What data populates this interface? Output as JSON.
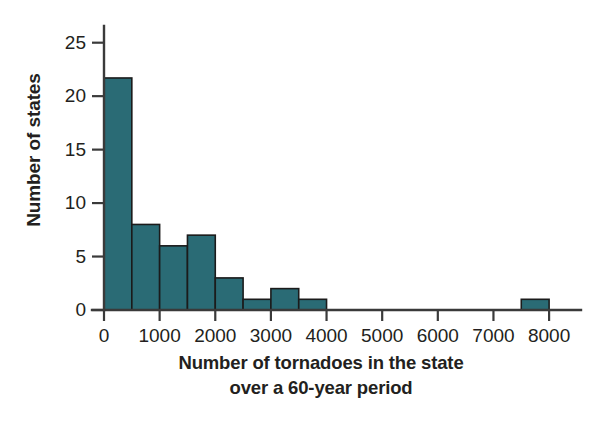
{
  "chart_data": {
    "type": "bar",
    "subtype": "histogram",
    "title": "",
    "subtitle": "",
    "xlabel": "Number of tornadoes in the state over a 60-year period",
    "xlabel_line1": "Number of tornadoes in the state",
    "xlabel_line2": "over a 60-year period",
    "ylabel": "Number of states",
    "xlim": [
      0,
      8250
    ],
    "ylim": [
      0,
      26
    ],
    "xticks": [
      0,
      1000,
      2000,
      3000,
      4000,
      5000,
      6000,
      7000,
      8000
    ],
    "xtick_labels": [
      "0",
      "1000",
      "2000",
      "3000",
      "4000",
      "5000",
      "6000",
      "7000",
      "8000"
    ],
    "yticks": [
      0,
      5,
      10,
      15,
      20,
      25
    ],
    "ytick_labels": [
      "0",
      "5",
      "10",
      "15",
      "20",
      "25"
    ],
    "grid": false,
    "legend": false,
    "legend_position": "none",
    "bin_width": 500,
    "bin_edges": [
      0,
      500,
      1000,
      1500,
      2000,
      2500,
      3000,
      3500,
      4000,
      7500,
      8000
    ],
    "categories": [
      "0-500",
      "500-1000",
      "1000-1500",
      "1500-2000",
      "2000-2500",
      "2500-3000",
      "3000-3500",
      "3500-4000",
      "7500-8000"
    ],
    "bars": [
      {
        "start": 0,
        "end": 500,
        "value": 21.7
      },
      {
        "start": 500,
        "end": 1000,
        "value": 8
      },
      {
        "start": 1000,
        "end": 1500,
        "value": 6
      },
      {
        "start": 1500,
        "end": 2000,
        "value": 7
      },
      {
        "start": 2000,
        "end": 2500,
        "value": 3
      },
      {
        "start": 2500,
        "end": 3000,
        "value": 1
      },
      {
        "start": 3000,
        "end": 3500,
        "value": 2
      },
      {
        "start": 3500,
        "end": 4000,
        "value": 1
      },
      {
        "start": 7500,
        "end": 8000,
        "value": 1
      }
    ],
    "values": [
      21.7,
      8,
      6,
      7,
      3,
      1,
      2,
      1,
      1
    ],
    "colors": {
      "bar_fill": "#2a6b75",
      "bar_edge": "#1b1b1b",
      "axis": "#3a3a3a",
      "text": "#231f20",
      "background": "#ffffff"
    }
  }
}
